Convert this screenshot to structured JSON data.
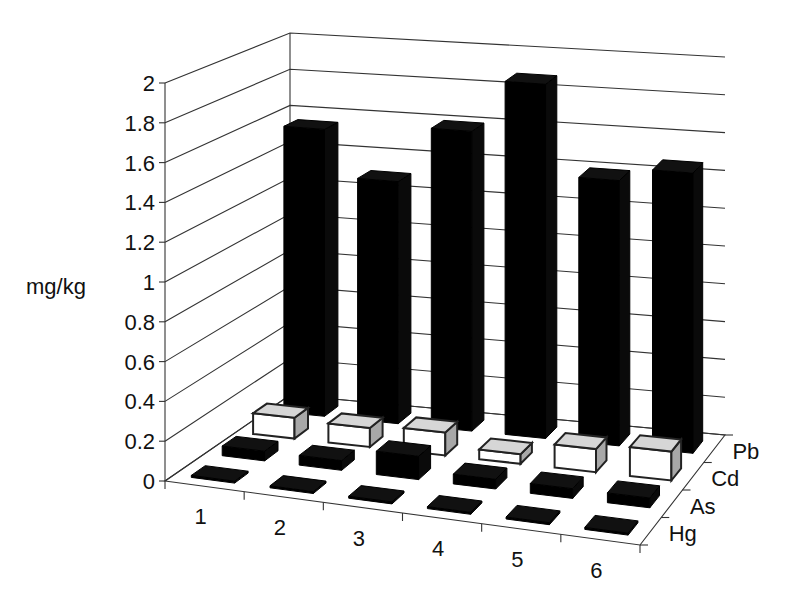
{
  "chart_data": {
    "type": "bar",
    "subtype": "3d-bar",
    "title": "",
    "xlabel": "",
    "ylabel": "mg/kg",
    "ylim": [
      0,
      2
    ],
    "yticks": [
      "0",
      "0.2",
      "0.4",
      "0.6",
      "0.8",
      "1",
      "1.2",
      "1.4",
      "1.6",
      "1.8",
      "2"
    ],
    "categories": [
      "1",
      "2",
      "3",
      "4",
      "5",
      "6"
    ],
    "depth_labels": [
      "Hg",
      "As",
      "Cd",
      "Pb"
    ],
    "grid": true,
    "series": [
      {
        "name": "Hg",
        "values": [
          0.01,
          0.01,
          0.01,
          0.01,
          0.01,
          0.01
        ],
        "color": "#000000"
      },
      {
        "name": "As",
        "values": [
          0.05,
          0.05,
          0.12,
          0.05,
          0.05,
          0.05
        ],
        "color": "#000000"
      },
      {
        "name": "Cd",
        "values": [
          0.11,
          0.1,
          0.12,
          0.05,
          0.12,
          0.15
        ],
        "color": "#ffffff"
      },
      {
        "name": "Pb",
        "values": [
          1.55,
          1.3,
          1.6,
          1.88,
          1.4,
          1.47
        ],
        "color": "#000000"
      }
    ]
  },
  "labels": {
    "y_axis_title": "mg/kg"
  }
}
